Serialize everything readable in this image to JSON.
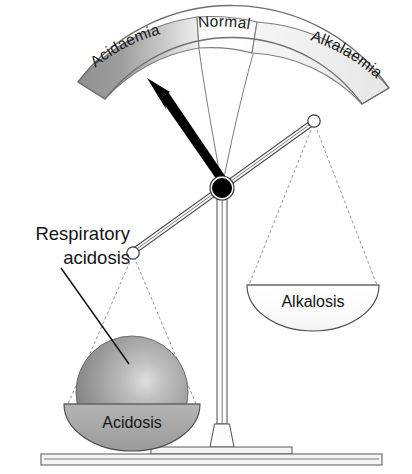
{
  "figure": {
    "background_color": "#ffffff"
  },
  "gauge_arc": {
    "name": "acid-base gauge band",
    "segments": [
      {
        "id": "acidaemia",
        "label": "Acidaemia",
        "fill_dark": "#8f8f8f",
        "fill_light": "#e8e8e8",
        "side": "left"
      },
      {
        "id": "normal",
        "label": "Normal",
        "fill_dark": "#fbfbfb",
        "fill_light": "#ffffff",
        "side": "center"
      },
      {
        "id": "alkalaemia",
        "label": "Alkalaemia",
        "fill_dark": "#ededed",
        "fill_light": "#f7f7f7",
        "side": "right"
      }
    ],
    "outline_color": "#7a7a7a"
  },
  "pointer": {
    "name": "needle",
    "label": "",
    "color": "#000000",
    "points_to": "Acidaemia"
  },
  "pans": {
    "left": {
      "id": "acidosis-pan",
      "label": "Acidosis",
      "fill": "#a8a8a8",
      "state": "down",
      "loaded": true
    },
    "right": {
      "id": "alkalosis-pan",
      "label": "Alkalosis",
      "fill": "#fbfbfb",
      "state": "up",
      "loaded": false
    }
  },
  "weight": {
    "name": "acidosis weight sphere",
    "label": "",
    "fill_highlight": "#d5d5d5",
    "fill_mid": "#9c9c9c",
    "fill_edge": "#6f6f6f"
  },
  "callout": {
    "name": "respiratory acidosis callout",
    "line1": "Respiratory",
    "line2": "acidosis",
    "color": "#141414"
  },
  "frame": {
    "column_color": "#fcfcfc",
    "base_color": "#f4f4f4",
    "stroke_color": "#5a5a5a"
  }
}
